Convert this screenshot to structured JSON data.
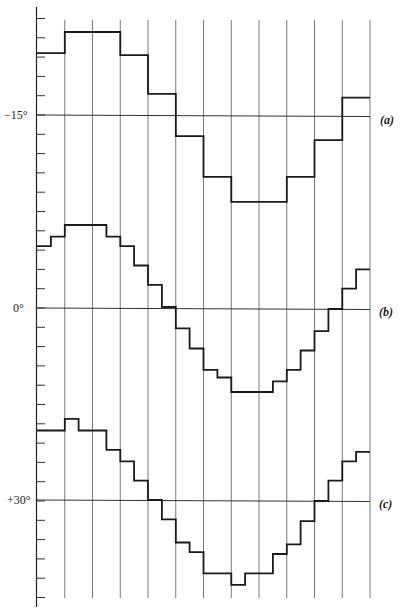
{
  "figure": {
    "columns": 12,
    "ticks_per_reference_gap": 10
  },
  "reference_lines": [
    {
      "id": "a",
      "value_label": "−15°",
      "curve_label": "(a)"
    },
    {
      "id": "b",
      "value_label": "0°",
      "curve_label": "(b)"
    },
    {
      "id": "c",
      "value_label": "+30°",
      "curve_label": "(c)"
    }
  ],
  "curves": [
    {
      "id": "a",
      "unit": "ticks above reference line",
      "steps": [
        {
          "from": 0,
          "to": 1,
          "value": 3.2
        },
        {
          "from": 1,
          "to": 3,
          "value": 4.3
        },
        {
          "from": 3,
          "to": 4,
          "value": 3.1
        },
        {
          "from": 4,
          "to": 5,
          "value": 1.1
        },
        {
          "from": 5,
          "to": 6,
          "value": -1.1
        },
        {
          "from": 6,
          "to": 7,
          "value": -3.2
        },
        {
          "from": 7,
          "to": 9,
          "value": -4.5
        },
        {
          "from": 9,
          "to": 10,
          "value": -3.2
        },
        {
          "from": 10,
          "to": 11,
          "value": -1.3
        },
        {
          "from": 11,
          "to": 12,
          "value": 0.9
        }
      ]
    },
    {
      "id": "b",
      "unit": "ticks above reference line",
      "steps": [
        {
          "from": 0,
          "to": 0.5,
          "value": 3.2
        },
        {
          "from": 0.5,
          "to": 1,
          "value": 3.7
        },
        {
          "from": 1,
          "to": 2.5,
          "value": 4.3
        },
        {
          "from": 2.5,
          "to": 3,
          "value": 3.7
        },
        {
          "from": 3,
          "to": 3.5,
          "value": 3.2
        },
        {
          "from": 3.5,
          "to": 4,
          "value": 2.2
        },
        {
          "from": 4,
          "to": 4.5,
          "value": 1.2
        },
        {
          "from": 4.5,
          "to": 5,
          "value": 0.05
        },
        {
          "from": 5,
          "to": 5.5,
          "value": -1.05
        },
        {
          "from": 5.5,
          "to": 6,
          "value": -2.1
        },
        {
          "from": 6,
          "to": 6.5,
          "value": -3.2
        },
        {
          "from": 6.5,
          "to": 7,
          "value": -3.6
        },
        {
          "from": 7,
          "to": 8.5,
          "value": -4.35
        },
        {
          "from": 8.5,
          "to": 9,
          "value": -3.8
        },
        {
          "from": 9,
          "to": 9.5,
          "value": -3.2
        },
        {
          "from": 9.5,
          "to": 10,
          "value": -2.2
        },
        {
          "from": 10,
          "to": 10.5,
          "value": -1.2
        },
        {
          "from": 10.5,
          "to": 11,
          "value": -0.05
        },
        {
          "from": 11,
          "to": 11.5,
          "value": 1.0
        },
        {
          "from": 11.5,
          "to": 12,
          "value": 2.0
        }
      ]
    },
    {
      "id": "c",
      "unit": "ticks above reference line",
      "steps": [
        {
          "from": 0,
          "to": 1,
          "value": 3.6
        },
        {
          "from": 1,
          "to": 1.5,
          "value": 4.2
        },
        {
          "from": 1.5,
          "to": 2.5,
          "value": 3.6
        },
        {
          "from": 2.5,
          "to": 3,
          "value": 2.6
        },
        {
          "from": 3,
          "to": 3.5,
          "value": 2.0
        },
        {
          "from": 3.5,
          "to": 4,
          "value": 1.0
        },
        {
          "from": 4,
          "to": 4.5,
          "value": 0.0
        },
        {
          "from": 4.5,
          "to": 5,
          "value": -1.0
        },
        {
          "from": 5,
          "to": 5.5,
          "value": -2.2
        },
        {
          "from": 5.5,
          "to": 6,
          "value": -2.7
        },
        {
          "from": 6,
          "to": 7,
          "value": -3.8
        },
        {
          "from": 7,
          "to": 7.5,
          "value": -4.4
        },
        {
          "from": 7.5,
          "to": 8.5,
          "value": -3.8
        },
        {
          "from": 8.5,
          "to": 9,
          "value": -2.8
        },
        {
          "from": 9,
          "to": 9.5,
          "value": -2.3
        },
        {
          "from": 9.5,
          "to": 10,
          "value": -1.1
        },
        {
          "from": 10,
          "to": 10.5,
          "value": -0.05
        },
        {
          "from": 10.5,
          "to": 11,
          "value": 1.0
        },
        {
          "from": 11,
          "to": 11.5,
          "value": 2.0
        },
        {
          "from": 11.5,
          "to": 12,
          "value": 2.5
        }
      ]
    }
  ]
}
